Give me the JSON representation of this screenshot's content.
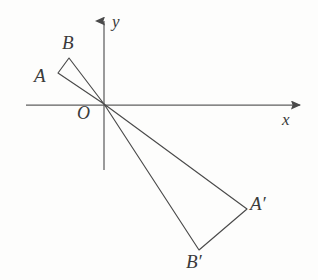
{
  "figure": {
    "kind": "geometry-diagram",
    "background_color": "#fdfdfc",
    "ink_color": "#4a4a4a",
    "axis_color": "#5a5a5a",
    "axes": {
      "origin_label": "O",
      "x_axis_label": "x",
      "y_axis_label": "y",
      "origin": {
        "x": 104,
        "y": 104
      },
      "x_axis": {
        "x1": 26,
        "y1": 105,
        "x2": 304,
        "y2": 105,
        "arrow": "right"
      },
      "y_axis": {
        "x1": 104,
        "y1": 170,
        "x2": 104,
        "y2": 16,
        "arrow": "up"
      }
    },
    "shapes": [
      {
        "name": "triangle-OAB",
        "vertices": [
          {
            "label": "O",
            "x": 104,
            "y": 104
          },
          {
            "label": "A",
            "x": 58,
            "y": 73
          },
          {
            "label": "B",
            "x": 69,
            "y": 58
          }
        ]
      },
      {
        "name": "triangle-OApBp",
        "vertices": [
          {
            "label": "O",
            "x": 104,
            "y": 104
          },
          {
            "label": "A'",
            "x": 247,
            "y": 209
          },
          {
            "label": "B'",
            "x": 199,
            "y": 250
          }
        ]
      }
    ],
    "labels": {
      "A": "A",
      "B": "B",
      "O": "O",
      "A_prime": "A′",
      "B_prime": "B′",
      "x": "x",
      "y": "y"
    }
  }
}
